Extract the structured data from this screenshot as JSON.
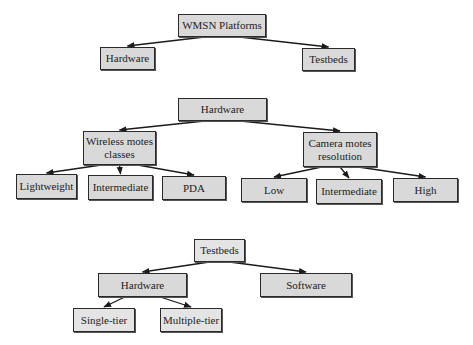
{
  "diagram": {
    "colors": {
      "node_fill": "#d9d9d9",
      "node_border": "#2a2a2a",
      "edge": "#1a1a1a"
    },
    "trees": [
      {
        "id": "tree1",
        "nodes": [
          {
            "id": "wmsn",
            "label": "WMSN Platforms"
          },
          {
            "id": "hw1",
            "label": "Hardware"
          },
          {
            "id": "tb1",
            "label": "Testbeds"
          }
        ],
        "edges": [
          [
            "wmsn",
            "hw1"
          ],
          [
            "wmsn",
            "tb1"
          ]
        ]
      },
      {
        "id": "tree2",
        "nodes": [
          {
            "id": "hw2",
            "label": "Hardware"
          },
          {
            "id": "wmc",
            "label": "Wireless motes classes"
          },
          {
            "id": "cmr",
            "label": "Camera motes resolution"
          },
          {
            "id": "lw",
            "label": "Lightweight"
          },
          {
            "id": "im1",
            "label": "Intermediate"
          },
          {
            "id": "pda",
            "label": "PDA"
          },
          {
            "id": "low",
            "label": "Low"
          },
          {
            "id": "im2",
            "label": "Intermediate"
          },
          {
            "id": "high",
            "label": "High"
          }
        ],
        "edges": [
          [
            "hw2",
            "wmc"
          ],
          [
            "hw2",
            "cmr"
          ],
          [
            "wmc",
            "lw"
          ],
          [
            "wmc",
            "im1"
          ],
          [
            "wmc",
            "pda"
          ],
          [
            "cmr",
            "low"
          ],
          [
            "cmr",
            "im2"
          ],
          [
            "cmr",
            "high"
          ]
        ]
      },
      {
        "id": "tree3",
        "nodes": [
          {
            "id": "tb3",
            "label": "Testbeds"
          },
          {
            "id": "hw3",
            "label": "Hardware"
          },
          {
            "id": "sw",
            "label": "Software"
          },
          {
            "id": "st",
            "label": "Single-tier"
          },
          {
            "id": "mt",
            "label": "Multiple-tier"
          }
        ],
        "edges": [
          [
            "tb3",
            "hw3"
          ],
          [
            "tb3",
            "sw"
          ],
          [
            "hw3",
            "st"
          ],
          [
            "hw3",
            "mt"
          ]
        ]
      }
    ]
  }
}
